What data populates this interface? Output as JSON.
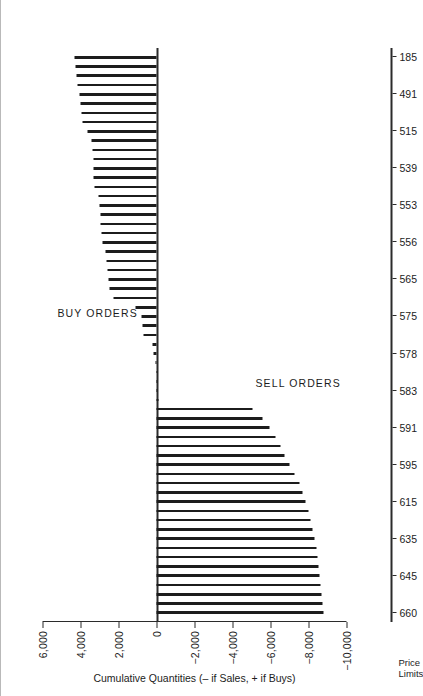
{
  "figure": {
    "corner_caption_line1": "Price",
    "corner_caption_line2": "Limits",
    "axis_title": "Cumulative Quantities (– if Sales, + if Buys)",
    "region_buy_label": "BUY ORDERS",
    "region_sell_label": "SELL ORDERS",
    "ink_color": "#1c1c1c",
    "background_color": "#ffffff"
  },
  "chart_data": {
    "type": "bar",
    "title": "",
    "subtitle": "",
    "orientation": "rotated-90",
    "xlabel": "Price Limits",
    "ylabel": "Cumulative Quantities (– if Sales, + if Buys)",
    "ylim": [
      -10000,
      6000
    ],
    "ytick_labels": [
      "6,000",
      "4,000",
      "2,000",
      "0",
      "−2,000",
      "−4,000",
      "−6,000",
      "−8,000",
      "−10,000"
    ],
    "ytick_values": [
      6000,
      4000,
      2000,
      0,
      -2000,
      -4000,
      -6000,
      -8000,
      -10000
    ],
    "grid": false,
    "legend": "none",
    "annotations": [
      "BUY ORDERS",
      "SELL ORDERS"
    ],
    "xtick_labels": [
      "660",
      "645",
      "635",
      "615",
      "595",
      "591",
      "583",
      "578",
      "575",
      "565",
      "556",
      "553",
      "539",
      "515",
      "491",
      "185"
    ],
    "xtick_label_positions": [
      0,
      4,
      8,
      12,
      16,
      20,
      24,
      28,
      32,
      36,
      40,
      44,
      48,
      52,
      56,
      60
    ],
    "categories": [
      "660",
      "657",
      "654",
      "651",
      "648",
      "645",
      "642",
      "639",
      "636",
      "635",
      "632",
      "629",
      "626",
      "623",
      "620",
      "615",
      "612",
      "609",
      "606",
      "603",
      "600",
      "595",
      "593",
      "592",
      "591",
      "589",
      "587",
      "585",
      "583",
      "582",
      "581",
      "580",
      "578",
      "577",
      "576",
      "575",
      "573",
      "571",
      "569",
      "565",
      "563",
      "561",
      "559",
      "556",
      "555",
      "554",
      "553",
      "551",
      "548",
      "545",
      "539",
      "535",
      "530",
      "525",
      "515",
      "508",
      "500",
      "491",
      "460",
      "300",
      "185"
    ],
    "values": [
      -8800,
      -8750,
      -8700,
      -8650,
      -8600,
      -8550,
      -8480,
      -8400,
      -8300,
      -8200,
      -8100,
      -8000,
      -7850,
      -7700,
      -7500,
      -7250,
      -7000,
      -6750,
      -6500,
      -6250,
      -5950,
      -5600,
      -5050,
      -120,
      -60,
      -30,
      0,
      60,
      170,
      230,
      700,
      760,
      790,
      1100,
      2250,
      2500,
      2550,
      2600,
      2620,
      2700,
      2850,
      2900,
      2930,
      2960,
      3000,
      3050,
      3250,
      3300,
      3320,
      3340,
      3380,
      3420,
      3620,
      3900,
      3950,
      4000,
      4060,
      4150,
      4200,
      4250,
      4300
    ]
  }
}
